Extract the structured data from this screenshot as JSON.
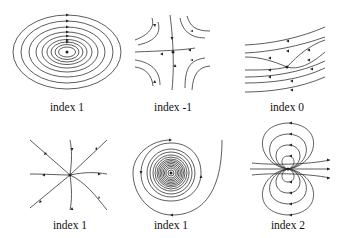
{
  "figure": {
    "panels": [
      {
        "label": "index 1",
        "type": "center (nested closed orbits)"
      },
      {
        "label": "index -1",
        "type": "saddle"
      },
      {
        "label": "index 0",
        "type": "regular flow (no singularity)"
      },
      {
        "label": "index 1",
        "type": "node (source)"
      },
      {
        "label": "index 1",
        "type": "spiral (focus)"
      },
      {
        "label": "index 2",
        "type": "dipole"
      }
    ]
  },
  "colors": {
    "stroke": "#333333",
    "background": "#ffffff"
  }
}
